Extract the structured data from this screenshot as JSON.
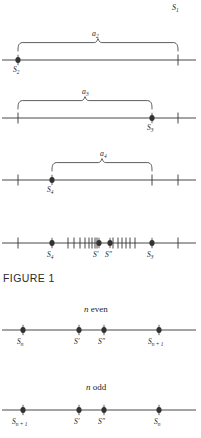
{
  "figure": {
    "caption": "FIGURE 1",
    "top_right_label": {
      "base": "S",
      "sub": "1"
    },
    "colors": {
      "ink": "#1f1f1f",
      "line": "#333333",
      "background": "#ffffff"
    }
  },
  "panels": [
    {
      "id": "panel-a2",
      "axis_y": 60,
      "brace": {
        "label_base": "a",
        "label_sub": "2",
        "x_start": 18,
        "x_end": 178,
        "label_x": 92,
        "label_y": 30
      },
      "points": [
        {
          "kind": "dot",
          "x": 18,
          "label_base": "S",
          "label_sub": "2",
          "label_x": 13,
          "label_y": 66
        },
        {
          "kind": "tick",
          "x": 178
        }
      ],
      "line_x1": 2,
      "line_x2": 196
    },
    {
      "id": "panel-a3",
      "axis_y": 118,
      "brace": {
        "label_base": "a",
        "label_sub": "3",
        "x_start": 18,
        "x_end": 152,
        "label_x": 82,
        "label_y": 88
      },
      "points": [
        {
          "kind": "tick",
          "x": 18
        },
        {
          "kind": "dot",
          "x": 152,
          "label_base": "S",
          "label_sub": "3",
          "label_x": 147,
          "label_y": 124
        },
        {
          "kind": "tick",
          "x": 178
        }
      ],
      "line_x1": 2,
      "line_x2": 196
    },
    {
      "id": "panel-a4",
      "axis_y": 180,
      "brace": {
        "label_base": "a",
        "label_sub": "4",
        "x_start": 52,
        "x_end": 152,
        "label_x": 100,
        "label_y": 150
      },
      "points": [
        {
          "kind": "tick",
          "x": 18
        },
        {
          "kind": "dot",
          "x": 52,
          "label_base": "S",
          "label_sub": "4",
          "label_x": 47,
          "label_y": 186
        },
        {
          "kind": "tick",
          "x": 152
        },
        {
          "kind": "tick",
          "x": 178
        }
      ],
      "line_x1": 2,
      "line_x2": 196
    }
  ],
  "dense_panel": {
    "id": "panel-dense",
    "axis_y": 243,
    "line_x1": 2,
    "line_x2": 196,
    "ticks": [
      18,
      68,
      74,
      80,
      85,
      89,
      92,
      95,
      97,
      113,
      118,
      122,
      126,
      130,
      135,
      178
    ],
    "dots": [
      {
        "x": 52,
        "label_base": "S",
        "label_sub": "4",
        "label_x": 47,
        "label_y": 251
      },
      {
        "x": 99,
        "label_base": "S",
        "prime": "′",
        "label_x": 93,
        "label_y": 251
      },
      {
        "x": 110,
        "label_base": "S",
        "prime": "″",
        "label_x": 105,
        "label_y": 251
      },
      {
        "x": 152,
        "label_base": "S",
        "label_sub": "3",
        "label_x": 147,
        "label_y": 251
      }
    ]
  },
  "parity_panels": [
    {
      "id": "panel-n-even",
      "title": "n even",
      "title_var": "n",
      "title_rest": " even",
      "title_x": 84,
      "title_y": 305,
      "axis_y": 330,
      "line_x1": 2,
      "line_x2": 196,
      "dots": [
        {
          "x": 23,
          "label_base": "S",
          "label_sub": "n",
          "label_x": 17,
          "label_y": 338
        },
        {
          "x": 79,
          "label_base": "S",
          "prime": "′",
          "label_x": 74,
          "label_y": 338
        },
        {
          "x": 104,
          "label_base": "S",
          "prime": "″",
          "label_x": 98,
          "label_y": 338
        },
        {
          "x": 159,
          "label_base": "S",
          "label_sub": "n + 1",
          "label_x": 148,
          "label_y": 338
        }
      ]
    },
    {
      "id": "panel-n-odd",
      "title": "n odd",
      "title_var": "n",
      "title_rest": " odd",
      "title_x": 86,
      "title_y": 383,
      "axis_y": 410,
      "line_x1": 2,
      "line_x2": 196,
      "dots": [
        {
          "x": 23,
          "label_base": "S",
          "label_sub": "n + 1",
          "label_x": 12,
          "label_y": 418
        },
        {
          "x": 79,
          "label_base": "S",
          "prime": "′",
          "label_x": 74,
          "label_y": 418
        },
        {
          "x": 104,
          "label_base": "S",
          "prime": "″",
          "label_x": 98,
          "label_y": 418
        },
        {
          "x": 159,
          "label_base": "S",
          "label_sub": "n",
          "label_x": 154,
          "label_y": 418
        }
      ]
    }
  ]
}
